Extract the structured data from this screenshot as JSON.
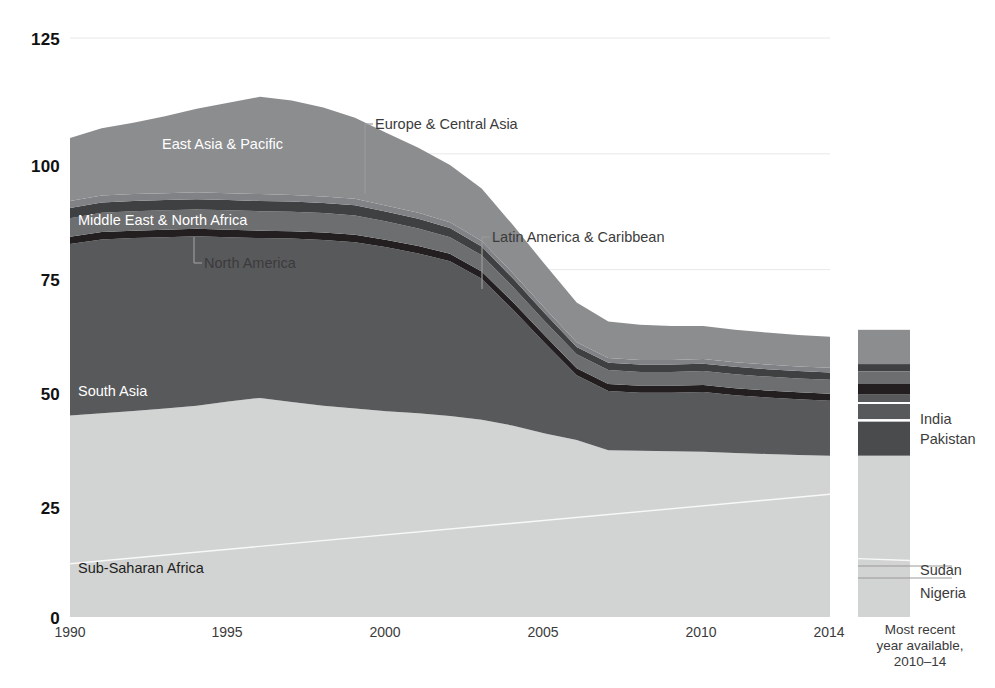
{
  "chart_data": {
    "type": "area",
    "title": "",
    "subtitle": "",
    "xlabel": "",
    "ylabel": "",
    "stacked": true,
    "grid": true,
    "legend_position": "inline-labels",
    "xlim": [
      1990,
      2014
    ],
    "ylim": [
      0,
      125
    ],
    "ytick_labels": [
      "125",
      "100",
      "75",
      "50",
      "25",
      "0"
    ],
    "ytick_values": [
      125,
      100,
      75,
      50,
      25,
      0
    ],
    "xtick_labels": [
      "1990",
      "1995",
      "2000",
      "2005",
      "2010",
      "2014"
    ],
    "xtick_values": [
      1990,
      1995,
      2000,
      2005,
      2010,
      2014
    ],
    "x": [
      1990,
      1991,
      1992,
      1993,
      1994,
      1995,
      1996,
      1997,
      1998,
      1999,
      2000,
      2001,
      2002,
      2003,
      2004,
      2005,
      2006,
      2007,
      2008,
      2009,
      2010,
      2011,
      2012,
      2013,
      2014
    ],
    "series": [
      {
        "name": "Sub-Saharan Africa",
        "color": "#d2d3d3",
        "values": [
          43.5,
          44.0,
          44.5,
          45.0,
          45.6,
          46.5,
          47.3,
          46.4,
          45.6,
          45.0,
          44.4,
          44.0,
          43.4,
          42.6,
          41.3,
          39.6,
          38.2,
          36.0,
          35.9,
          35.8,
          35.7,
          35.4,
          35.2,
          35.0,
          34.8
        ]
      },
      {
        "name": "South Asia",
        "color": "#58595b",
        "values": [
          37.0,
          37.5,
          37.3,
          37.0,
          36.6,
          35.5,
          34.5,
          35.3,
          35.8,
          35.9,
          35.4,
          34.5,
          33.4,
          30.4,
          25.0,
          19.5,
          14.0,
          12.8,
          12.5,
          12.6,
          12.9,
          12.5,
          12.2,
          12.0,
          11.9
        ]
      },
      {
        "name": "North America",
        "color": "#231f20",
        "values": [
          1.6,
          1.6,
          1.6,
          1.6,
          1.6,
          1.6,
          1.6,
          1.6,
          1.6,
          1.6,
          1.6,
          1.6,
          1.6,
          1.6,
          1.6,
          1.6,
          1.5,
          1.5,
          1.5,
          1.5,
          1.5,
          1.5,
          1.5,
          1.5,
          1.5
        ]
      },
      {
        "name": "Middle East & North Africa",
        "color": "#6d6e70",
        "values": [
          4.0,
          4.2,
          4.2,
          4.2,
          4.2,
          4.2,
          4.2,
          4.2,
          4.2,
          4.2,
          4.0,
          3.8,
          3.6,
          3.5,
          3.3,
          3.1,
          3.0,
          3.0,
          3.0,
          3.0,
          3.0,
          3.0,
          3.0,
          3.0,
          3.0
        ]
      },
      {
        "name": "Latin America & Caribbean",
        "color": "#3f4042",
        "values": [
          2.2,
          2.2,
          2.2,
          2.2,
          2.2,
          2.2,
          2.2,
          2.2,
          2.2,
          2.2,
          2.1,
          2.1,
          2.0,
          1.9,
          1.8,
          1.7,
          1.6,
          1.6,
          1.6,
          1.6,
          1.6,
          1.6,
          1.6,
          1.6,
          1.6
        ]
      },
      {
        "name": "Europe & Central Asia",
        "color": "#808285",
        "values": [
          1.5,
          1.5,
          1.5,
          1.5,
          1.5,
          1.5,
          1.5,
          1.4,
          1.4,
          1.4,
          1.3,
          1.3,
          1.2,
          1.2,
          1.1,
          1.1,
          1.0,
          1.0,
          1.0,
          1.0,
          1.0,
          1.0,
          1.0,
          1.0,
          1.0
        ]
      },
      {
        "name": "East Asia & Pacific",
        "color": "#8b8d8f",
        "values": [
          13.6,
          14.5,
          15.4,
          16.6,
          18.0,
          19.5,
          21.0,
          20.4,
          19.2,
          17.5,
          15.7,
          14.0,
          12.4,
          11.3,
          10.4,
          9.5,
          8.6,
          7.9,
          7.6,
          7.3,
          7.1,
          7.0,
          6.9,
          6.8,
          6.7
        ]
      }
    ],
    "totals": [
      103.4,
      105.5,
      106.7,
      108.1,
      109.7,
      111.0,
      112.3,
      111.5,
      110.0,
      107.8,
      104.5,
      101.3,
      97.6,
      91.5,
      84.5,
      76.1,
      67.9,
      63.8,
      63.1,
      62.8,
      62.8,
      62.0,
      61.4,
      60.9,
      60.4
    ],
    "area_labels": [
      {
        "text": "East Asia & Pacific",
        "x": 162,
        "y": 136,
        "color": "#ffffff"
      },
      {
        "text": "Middle East & North Africa",
        "x": 78,
        "y": 212,
        "color": "#ffffff"
      },
      {
        "text": "South Asia",
        "x": 78,
        "y": 383,
        "color": "#ffffff"
      },
      {
        "text": "Sub-Saharan Africa",
        "x": 78,
        "y": 560,
        "color": "#231f20"
      }
    ],
    "callouts": [
      {
        "text": "Europe & Central Asia",
        "label_x": 375,
        "label_y": 116,
        "elbow_x": 365,
        "elbow_y": 124,
        "line_bottom_y": 194
      },
      {
        "text": "North America",
        "label_x": 204,
        "label_y": 255,
        "elbow_x": 194,
        "elbow_y": 263,
        "line_top_y": 237
      },
      {
        "text": "Latin America & Caribbean",
        "label_x": 492,
        "label_y": 229,
        "elbow_x": 482,
        "elbow_y": 237,
        "line_bottom_y": 289
      }
    ]
  },
  "side_bar": {
    "caption": "Most recent\nyear available,\n2010–14",
    "top_value": 62.0,
    "segments": [
      {
        "name": "East Asia & Pacific",
        "color": "#8b8d8f",
        "from": 54.6,
        "to": 62.0
      },
      {
        "name": "Europe & Central Asia",
        "color": "#3f4042",
        "from": 53.0,
        "to": 54.6
      },
      {
        "name": "Latin America & Caribbean",
        "color": "#6d6e70",
        "from": 50.4,
        "to": 53.0
      },
      {
        "name": "Middle East & North Africa",
        "color": "#231f20",
        "from": 48.0,
        "to": 50.4
      },
      {
        "name": "North America",
        "color": "#58595b",
        "from": 46.4,
        "to": 48.0
      },
      {
        "name": "India",
        "color": "#58595b",
        "from": 42.7,
        "to": 46.0
      },
      {
        "name": "Pakistan",
        "color": "#4a4b4d",
        "from": 34.8,
        "to": 42.2
      },
      {
        "name": "Sub-Saharan Africa",
        "color": "#d2d3d3",
        "from": 0.0,
        "to": 34.8
      }
    ],
    "labels": [
      {
        "text": "India",
        "x": 920,
        "y": 411
      },
      {
        "text": "Pakistan",
        "x": 920,
        "y": 431
      },
      {
        "text": "Sudan",
        "x": 920,
        "y": 562
      },
      {
        "text": "Nigeria",
        "x": 920,
        "y": 585
      }
    ],
    "divider_lines_y": [
      566,
      578
    ]
  },
  "axis": {
    "ytick_x": 4,
    "ytick_positions_y": [
      30,
      157,
      271,
      385,
      499,
      609
    ],
    "xtick_positions_x": [
      35,
      192,
      350,
      508,
      666,
      794
    ],
    "xtick_y": 624
  },
  "colors": {
    "background": "#ffffff",
    "gridline": "#e8e8e8",
    "text_dark": "#231f20",
    "text_muted": "#3b3b3b",
    "text_light": "#ffffff",
    "leader_line": "#9a9a9a",
    "sub_saharan_africa": "#d2d3d3",
    "south_asia": "#58595b",
    "north_america": "#231f20",
    "middle_east_north_africa": "#6d6e70",
    "latin_america_caribbean": "#3f4042",
    "europe_central_asia": "#808285",
    "east_asia_pacific": "#8b8d8f"
  }
}
